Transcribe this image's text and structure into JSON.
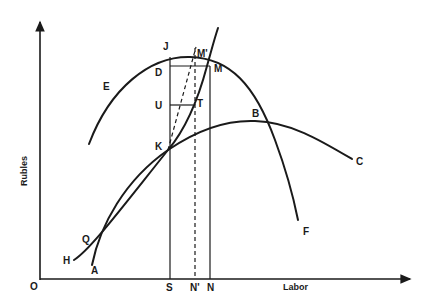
{
  "axes": {
    "y_label": "Rubles",
    "x_label": "Labor",
    "origin_label": "O"
  },
  "curves": {
    "E": {
      "label": "E",
      "start_label": "E",
      "end_label": "F",
      "description": "inverted-U curve E to F"
    },
    "H": {
      "label": "H",
      "end_label": "C",
      "description": "concave curve H to C"
    },
    "A": {
      "label": "A",
      "description": "steep rising curve from A through Q, K, T, M"
    }
  },
  "points": {
    "J": "J",
    "M_prime": "M'",
    "D": "D",
    "M": "M",
    "U": "U",
    "T": "T",
    "K": "K",
    "B": "B",
    "Q": "Q",
    "C": "C",
    "F": "F",
    "H": "H",
    "A": "A"
  },
  "ticks": {
    "S": "S",
    "N_prime": "N'",
    "N": "N"
  },
  "colors": {
    "ink": "#1a1a1a",
    "background": "#ffffff"
  }
}
